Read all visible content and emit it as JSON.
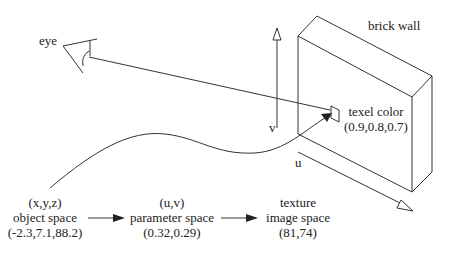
{
  "diagram": {
    "colors": {
      "stroke": "#333333",
      "text": "#222222",
      "background": "#ffffff"
    },
    "labels": {
      "eye": "eye",
      "brick_wall": "brick wall",
      "v_axis": "v",
      "u_axis": "u",
      "texel_title": "texel color",
      "texel_value": "(0.9,0.8,0.7)"
    },
    "pipeline": [
      {
        "top": "(x,y,z)",
        "name": "object space",
        "value": "(-2.3,7.1,88.2)"
      },
      {
        "top": "(u,v)",
        "name": "parameter space",
        "value": "(0.32,0.29)"
      },
      {
        "top": "texture",
        "name": "image space",
        "value": "(81,74)"
      }
    ],
    "icons": [
      "eye-icon",
      "brick-wall-shape",
      "texel-square",
      "v-axis-arrow",
      "u-axis-arrow",
      "mapping-curve-arrow",
      "view-ray",
      "pipeline-arrow"
    ]
  }
}
